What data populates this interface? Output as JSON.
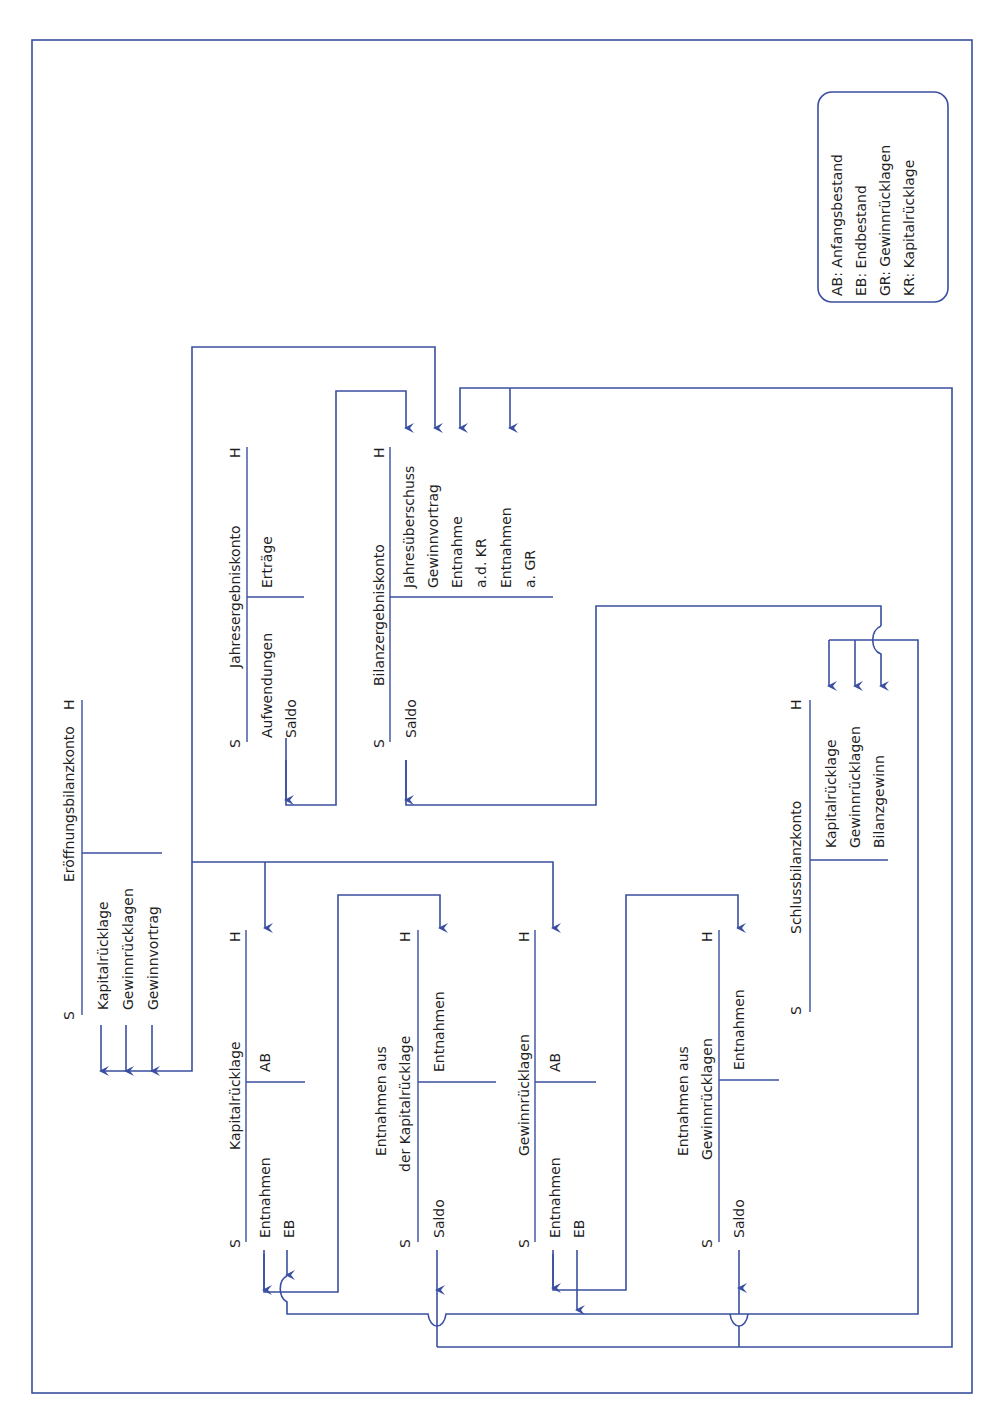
{
  "legend": {
    "items": [
      "AB: Anfangsbestand",
      "EB: Endbestand",
      "GR: Gewinnrücklagen",
      "KR: Kapitalrücklage"
    ]
  },
  "accounts": {
    "eroeffnung": {
      "title": "Eröffnungsbilanzkonto",
      "soll": "S",
      "haben": "H",
      "debit_entries": [
        "Kapitalrücklage",
        "Gewinnrücklagen",
        "Gewinnvortrag"
      ],
      "credit_entries": []
    },
    "jahresergebnis": {
      "title": "Jahresergebniskonto",
      "soll": "S",
      "haben": "H",
      "debit_entries": [
        "Aufwendungen",
        "Saldo"
      ],
      "credit_entries": [
        "Erträge"
      ]
    },
    "bilanzergebnis": {
      "title": "Bilanzergebniskonto",
      "soll": "S",
      "haben": "H",
      "debit_entries": [
        "Saldo"
      ],
      "credit_entries": [
        "Jahresüberschuss",
        "Gewinnvortrag",
        "Entnahme",
        "a.d. KR",
        "Entnahmen",
        "a. GR"
      ]
    },
    "kapitalruecklage": {
      "title": "Kapitalrücklage",
      "soll": "S",
      "haben": "H",
      "debit_entries": [
        "Entnahmen",
        "EB"
      ],
      "credit_entries": [
        "AB"
      ]
    },
    "entnahmen_kr": {
      "title_lines": [
        "Entnahmen aus",
        "der Kapitalrücklage"
      ],
      "soll": "S",
      "haben": "H",
      "debit_entries": [
        "Saldo"
      ],
      "credit_entries": [
        "Entnahmen"
      ]
    },
    "gewinnruecklagen": {
      "title": "Gewinnrücklagen",
      "soll": "S",
      "haben": "H",
      "debit_entries": [
        "Entnahmen",
        "EB"
      ],
      "credit_entries": [
        "AB"
      ]
    },
    "entnahmen_gr": {
      "title_lines": [
        "Entnahmen aus",
        "Gewinnrücklagen"
      ],
      "soll": "S",
      "haben": "H",
      "debit_entries": [
        "Saldo"
      ],
      "credit_entries": [
        "Entnahmen"
      ]
    },
    "schlussbilanz": {
      "title": "Schlussbilanzkonto",
      "soll": "S",
      "haben": "H",
      "debit_entries": [],
      "credit_entries": [
        "Kapitalrücklage",
        "Gewinnrücklagen",
        "Bilanzgewinn"
      ]
    }
  },
  "colors": {
    "line": "#3a4fa0",
    "text": "#1f1f1f",
    "background": "#ffffff"
  }
}
